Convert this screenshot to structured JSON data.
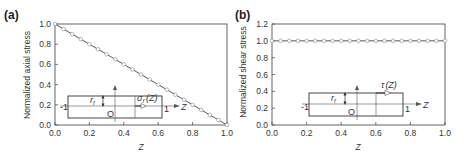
{
  "chart_data": [
    {
      "panel": "(a)",
      "type": "line",
      "title": "",
      "xlabel": "Z",
      "ylabel": "Normalized axial stress",
      "xlim": [
        0.0,
        1.0
      ],
      "ylim": [
        0.0,
        1.0
      ],
      "xticks": [
        "0.0",
        "0.2",
        "0.4",
        "0.6",
        "0.8",
        "1.0"
      ],
      "yticks": [
        "0.0",
        "0.2",
        "0.4",
        "0.6",
        "0.8",
        "1.0"
      ],
      "grid": false,
      "marker": "open-circle",
      "x": [
        0.0,
        0.05,
        0.1,
        0.15,
        0.2,
        0.25,
        0.3,
        0.35,
        0.4,
        0.45,
        0.5,
        0.55,
        0.6,
        0.65,
        0.7,
        0.75,
        0.8,
        0.85,
        0.9,
        0.95,
        1.0
      ],
      "y": [
        1.0,
        0.95,
        0.9,
        0.85,
        0.8,
        0.75,
        0.7,
        0.65,
        0.6,
        0.55,
        0.5,
        0.45,
        0.4,
        0.35,
        0.3,
        0.25,
        0.2,
        0.15,
        0.1,
        0.05,
        0.0
      ],
      "inset": {
        "labels": [
          "r_f",
          "σ_f (Z)",
          "O",
          "-1",
          "1",
          "Z"
        ]
      }
    },
    {
      "panel": "(b)",
      "type": "line",
      "title": "",
      "xlabel": "Z",
      "ylabel": "Normalized shear stress",
      "xlim": [
        0.0,
        1.0
      ],
      "ylim": [
        0.0,
        1.2
      ],
      "xticks": [
        "0.0",
        "0.2",
        "0.4",
        "0.6",
        "0.8",
        "1.0"
      ],
      "yticks": [
        "0.0",
        "0.2",
        "0.4",
        "0.6",
        "0.8",
        "1.0",
        "1.2"
      ],
      "grid": false,
      "marker": "open-circle",
      "x": [
        0.0,
        0.05,
        0.1,
        0.15,
        0.2,
        0.25,
        0.3,
        0.35,
        0.4,
        0.45,
        0.5,
        0.55,
        0.6,
        0.65,
        0.7,
        0.75,
        0.8,
        0.85,
        0.9,
        0.95,
        1.0
      ],
      "y": [
        1.0,
        1.0,
        1.0,
        1.0,
        1.0,
        1.0,
        1.0,
        1.0,
        1.0,
        1.0,
        1.0,
        1.0,
        1.0,
        1.0,
        1.0,
        1.0,
        1.0,
        1.0,
        1.0,
        1.0,
        1.0
      ],
      "inset": {
        "labels": [
          "r_f",
          "τ (Z)",
          "O",
          "-1",
          "1",
          "Z"
        ]
      }
    }
  ],
  "panels": {
    "a": {
      "label": "(a)",
      "ylabel": "Normalized axial stress",
      "xlabel": "Z",
      "inset": {
        "r": "r",
        "r_sub": "f",
        "sigma": "σ",
        "sigma_sub": "f",
        "sigma_arg": "(Z)",
        "origin": "O",
        "left": "-1",
        "right": "1",
        "axis": "Z"
      }
    },
    "b": {
      "label": "(b)",
      "ylabel": "Normalized shear stress",
      "xlabel": "Z",
      "inset": {
        "r": "r",
        "r_sub": "f",
        "tau": "τ",
        "tau_arg": "(Z)",
        "origin": "O",
        "left": "-1",
        "right": "1",
        "axis": "Z"
      }
    }
  },
  "colors": {
    "axis": "#555555",
    "line": "#444444",
    "marker_fill": "#ffffff",
    "marker_edge": "#888888",
    "text": "#333333"
  }
}
